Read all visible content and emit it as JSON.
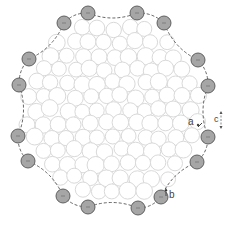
{
  "diagram": {
    "type": "circle-packing-cluster",
    "center": [
      113,
      110
    ],
    "cluster_radius": 95,
    "colors": {
      "background": "#ffffff",
      "inner_circle_stroke": "#d9d9d9",
      "inner_circle_fill": "#ffffff",
      "boundary_circle_fill": "#a6a6a6",
      "boundary_circle_stroke": "#555555",
      "chain_stroke": "#555555",
      "label": "#444444"
    },
    "boundary_circles": [
      {
        "x": 88,
        "y": 13
      },
      {
        "x": 137,
        "y": 13
      },
      {
        "x": 164,
        "y": 23
      },
      {
        "x": 198,
        "y": 60
      },
      {
        "x": 208,
        "y": 86
      },
      {
        "x": 208,
        "y": 137
      },
      {
        "x": 197,
        "y": 162
      },
      {
        "x": 161,
        "y": 197
      },
      {
        "x": 138,
        "y": 208
      },
      {
        "x": 88,
        "y": 207
      },
      {
        "x": 63,
        "y": 196
      },
      {
        "x": 28,
        "y": 161
      },
      {
        "x": 18,
        "y": 136
      },
      {
        "x": 19,
        "y": 85
      },
      {
        "x": 29,
        "y": 59
      },
      {
        "x": 64,
        "y": 23
      }
    ],
    "boundary_circle_radius": 7,
    "inner_circle_radius": 8,
    "labels": [
      {
        "id": "a",
        "text": "a",
        "x": 191,
        "y": 120
      },
      {
        "id": "b",
        "text": "b",
        "x": 168,
        "y": 192
      },
      {
        "id": "c",
        "text": "c",
        "x": 218,
        "y": 116
      }
    ]
  }
}
